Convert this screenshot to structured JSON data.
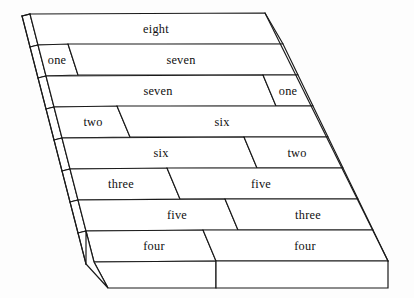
{
  "figure": {
    "total": "eight",
    "background_color": "#fdfdfd",
    "line_color": "#1a1a1a",
    "face_color": "#ffffff",
    "text_color": "#101010",
    "rows": [
      {
        "index": 0,
        "cells": [
          {
            "label": "eight",
            "value": 8
          }
        ]
      },
      {
        "index": 1,
        "cells": [
          {
            "label": "one",
            "value": 1
          },
          {
            "label": "seven",
            "value": 7
          }
        ]
      },
      {
        "index": 2,
        "cells": [
          {
            "label": "seven",
            "value": 7
          },
          {
            "label": "one",
            "value": 1
          }
        ]
      },
      {
        "index": 3,
        "cells": [
          {
            "label": "two",
            "value": 2
          },
          {
            "label": "six",
            "value": 6
          }
        ]
      },
      {
        "index": 4,
        "cells": [
          {
            "label": "six",
            "value": 6
          },
          {
            "label": "two",
            "value": 2
          }
        ]
      },
      {
        "index": 5,
        "cells": [
          {
            "label": "three",
            "value": 3
          },
          {
            "label": "five",
            "value": 5
          }
        ]
      },
      {
        "index": 6,
        "cells": [
          {
            "label": "five",
            "value": 5
          },
          {
            "label": "three",
            "value": 3
          }
        ]
      },
      {
        "index": 7,
        "cells": [
          {
            "label": "four",
            "value": 4
          },
          {
            "label": "four",
            "value": 4
          }
        ]
      }
    ]
  }
}
